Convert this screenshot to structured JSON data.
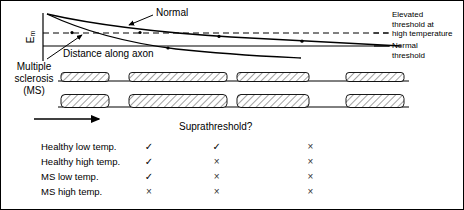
{
  "figure": {
    "axis": {
      "y_label_main": "E",
      "y_label_sub": "m",
      "x_label": "Distance along axon"
    },
    "curve_labels": {
      "normal": "Normal",
      "ms": "Multiple\nsclerosis\n(MS)"
    },
    "legend": {
      "elevated_threshold": "Elevated\nthreshold at\nhigh temperature",
      "normal_threshold": "Normal\nthreshold"
    },
    "colors": {
      "line": "#000000",
      "hatch": "#555555",
      "background": "#ffffff",
      "border": "#000000"
    },
    "axon_rows": [
      {
        "name": "healthy-axon",
        "segments": [
          {
            "x": 60,
            "w": 48,
            "h": 9
          },
          {
            "x": 128,
            "w": 98,
            "h": 9
          },
          {
            "x": 236,
            "w": 72,
            "h": 9
          },
          {
            "x": 345,
            "w": 58,
            "h": 9
          }
        ],
        "baseline_y": 80
      },
      {
        "name": "ms-axon",
        "segments": [
          {
            "x": 60,
            "w": 48,
            "h": 13
          },
          {
            "x": 128,
            "w": 98,
            "h": 13
          },
          {
            "x": 236,
            "w": 72,
            "h": 13
          },
          {
            "x": 345,
            "w": 58,
            "h": 13
          }
        ],
        "baseline_y": 106
      }
    ],
    "propagation_arrow": {
      "x1": 33,
      "y": 118,
      "x2": 101
    }
  },
  "chart_data": {
    "type": "line",
    "title": "",
    "xlabel": "Distance along axon",
    "ylabel": "Em",
    "grid": false,
    "legend_position": "right",
    "annotations": [
      {
        "text": "Normal",
        "target": "normal-decay-curve"
      },
      {
        "text": "Multiple sclerosis (MS)",
        "target": "ms-decay-curve"
      },
      {
        "text": "Elevated threshold at high temperature",
        "target": "elevated-threshold-line"
      },
      {
        "text": "Normal threshold",
        "target": "normal-threshold-line"
      }
    ],
    "series": [
      {
        "name": "Normal",
        "style": "solid",
        "points": [
          [
            0,
            100
          ],
          [
            12,
            86
          ],
          [
            25,
            76
          ],
          [
            40,
            68
          ],
          [
            55,
            62
          ],
          [
            70,
            57
          ],
          [
            85,
            53
          ],
          [
            100,
            50
          ]
        ]
      },
      {
        "name": "Multiple sclerosis (MS)",
        "style": "solid",
        "points": [
          [
            0,
            100
          ],
          [
            12,
            78
          ],
          [
            25,
            62
          ],
          [
            40,
            50
          ],
          [
            55,
            42
          ],
          [
            70,
            36
          ],
          [
            85,
            32
          ],
          [
            100,
            30
          ]
        ]
      },
      {
        "name": "Elevated threshold at high temperature",
        "style": "dashed",
        "points": [
          [
            0,
            62
          ],
          [
            100,
            62
          ]
        ]
      },
      {
        "name": "Normal threshold",
        "style": "solid",
        "points": [
          [
            0,
            48
          ],
          [
            100,
            48
          ]
        ]
      }
    ]
  },
  "table": {
    "header": "Suprathreshold?",
    "rows": [
      {
        "label": "Healthy low temp.",
        "marks": [
          "✓",
          "✓",
          "×"
        ]
      },
      {
        "label": "Healthy high temp.",
        "marks": [
          "✓",
          "×",
          "×"
        ]
      },
      {
        "label": "MS low temp.",
        "marks": [
          "✓",
          "×",
          "×"
        ]
      },
      {
        "label": "MS high temp.",
        "marks": [
          "×",
          "×",
          "×"
        ]
      }
    ]
  }
}
